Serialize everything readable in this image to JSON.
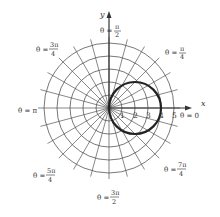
{
  "chart_data": {
    "type": "polar",
    "title": "",
    "curve": {
      "equation": "r = 4 cos θ",
      "description": "circle of radius 2 centered at (2,0), passing through origin",
      "color": "#222222"
    },
    "grid": {
      "circles": [
        1,
        2,
        3,
        4,
        5
      ],
      "radial_step_degrees": 15,
      "grid_color": "#555555"
    },
    "axes": {
      "x_label": "x",
      "y_label": "y"
    },
    "radial_tick_labels": [
      "1",
      "2",
      "3",
      "4",
      "5"
    ],
    "angle_labels": [
      {
        "text": "θ = 0",
        "angle_deg": 0
      },
      {
        "text": "θ = π/4",
        "angle_deg": 45
      },
      {
        "text": "θ = π/2",
        "angle_deg": 90
      },
      {
        "text": "θ = 3π/4",
        "angle_deg": 135
      },
      {
        "text": "θ = π",
        "angle_deg": 180
      },
      {
        "text": "θ = 5π/4",
        "angle_deg": 225
      },
      {
        "text": "θ = 3π/2",
        "angle_deg": 270
      },
      {
        "text": "θ = 7π/4",
        "angle_deg": 315
      }
    ]
  },
  "labels": {
    "x_axis": "x",
    "y_axis": "y",
    "theta_prefix": "θ = ",
    "t0": "0",
    "t_pi": "π",
    "pi_over": "π",
    "three_pi": "3π",
    "five_pi": "5π",
    "seven_pi": "7π",
    "den2": "2",
    "den4": "4",
    "ticks": [
      "1",
      "2",
      "3",
      "4",
      "5"
    ]
  }
}
